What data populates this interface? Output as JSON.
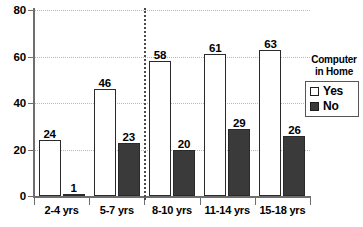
{
  "chart_data": {
    "type": "bar",
    "title": "",
    "subtitle": "",
    "xlabel": "",
    "ylabel": "",
    "ylim": [
      0,
      80
    ],
    "yticks": [
      0,
      20,
      40,
      60,
      80
    ],
    "grid": true,
    "grid_style": "dotted horizontal",
    "legend_position": "right",
    "legend_title": "Computer in Home",
    "legend_title_lines": [
      "Computer",
      "in Home"
    ],
    "categories": [
      "2-4 yrs",
      "5-7 yrs",
      "8-10 yrs",
      "11-14 yrs",
      "15-18 yrs"
    ],
    "series": [
      {
        "name": "Yes",
        "color": "#ffffff",
        "edge_color": "#2a2a2a",
        "values": [
          24,
          46,
          58,
          61,
          63
        ]
      },
      {
        "name": "No",
        "color": "#3a3a3a",
        "edge_color": "#2a2a2a",
        "values": [
          1,
          23,
          20,
          29,
          26
        ]
      }
    ],
    "annotations": [
      {
        "type": "vertical-divider",
        "after_category": "5-7 yrs",
        "style": "dotted"
      }
    ]
  },
  "colors": {
    "background": "#ffffff",
    "axis": "#6e6e6e",
    "grid": "#b8b8b8",
    "text": "#000000",
    "bar_yes": "#ffffff",
    "bar_no": "#3a3a3a",
    "divider": "#4a4a4a"
  },
  "legend": {
    "title_line1": "Computer",
    "title_line2": "in Home",
    "items": [
      {
        "label": "Yes",
        "swatch": "hollow-square"
      },
      {
        "label": "No",
        "swatch": "filled-square"
      }
    ]
  },
  "y_axis": {
    "ticks": [
      {
        "label": "80",
        "value": 80
      },
      {
        "label": "60",
        "value": 60
      },
      {
        "label": "40",
        "value": 40
      },
      {
        "label": "20",
        "value": 20
      },
      {
        "label": "0",
        "value": 0
      }
    ]
  },
  "x_axis": {
    "categories": [
      {
        "label": "2-4 yrs"
      },
      {
        "label": "5-7 yrs"
      },
      {
        "label": "8-10 yrs"
      },
      {
        "label": "11-14 yrs"
      },
      {
        "label": "15-18 yrs"
      }
    ]
  }
}
